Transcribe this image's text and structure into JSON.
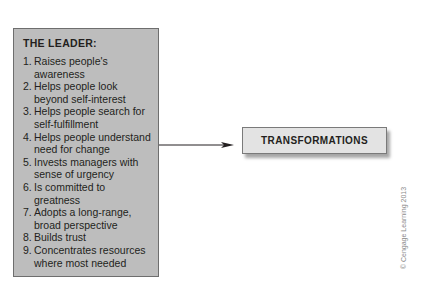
{
  "leader_box": {
    "title": "THE LEADER:",
    "items": [
      {
        "num": "1.",
        "text": "Raises people's awareness"
      },
      {
        "num": "2.",
        "text": "Helps people look beyond self-interest"
      },
      {
        "num": "3.",
        "text": "Helps people search for self-fulfillment"
      },
      {
        "num": "4.",
        "text": "Helps people understand need for change"
      },
      {
        "num": "5.",
        "text": "Invests managers with sense of urgency"
      },
      {
        "num": "6.",
        "text": "Is committed to greatness"
      },
      {
        "num": "7.",
        "text": "Adopts a long-range, broad perspective"
      },
      {
        "num": "8.",
        "text": "Builds trust"
      },
      {
        "num": "9.",
        "text": "Concentrates resources where most needed"
      }
    ]
  },
  "outcome_box": {
    "label": "TRANSFORMATIONS"
  },
  "connector": {
    "from": "THE LEADER",
    "to": "TRANSFORMATIONS",
    "icon": "arrow-right-icon"
  },
  "watermark": "© Cengage Learning 2013",
  "colors": {
    "leader_box_fill": "#bdbdbd",
    "outcome_box_fill": "#e3e3e3",
    "border": "#6e6e6e",
    "text": "#231f20"
  }
}
